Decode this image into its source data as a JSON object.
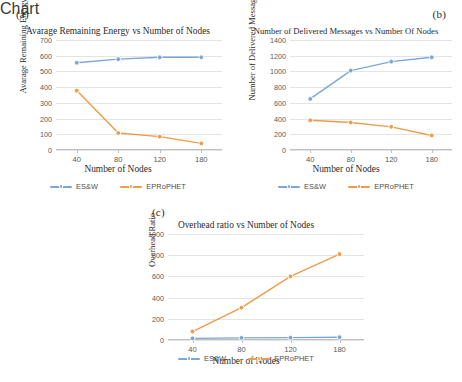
{
  "figure": {
    "panels": [
      {
        "id": "a",
        "label": "(a)",
        "chart_data": {
          "type": "line",
          "title": "Avarage Remaining Energy vs Number of Nodes",
          "xlabel": "Number of Nodes",
          "ylabel": "Avarage Remaining Energy",
          "categories": [
            "40",
            "80",
            "120",
            "180"
          ],
          "yticks": [
            "0",
            "100",
            "200",
            "300",
            "400",
            "500",
            "600",
            "700"
          ],
          "ylim": [
            0,
            700
          ],
          "grid": true,
          "legend_position": "bottom",
          "series": [
            {
              "name": "ES&W",
              "color": "#7BA7D7",
              "values": [
                555,
                578,
                590,
                590
              ]
            },
            {
              "name": "EPRoPHET",
              "color": "#ED9C4C",
              "values": [
                378,
                108,
                85,
                42
              ]
            }
          ]
        }
      },
      {
        "id": "b",
        "label": "(b)",
        "chart_data": {
          "type": "line",
          "title": "Number of Delivered Messages vs Number Of Nodes",
          "xlabel": "Number of Nodes",
          "ylabel": "Number of Delivered Messages",
          "categories": [
            "40",
            "80",
            "120",
            "180"
          ],
          "yticks": [
            "0",
            "200",
            "400",
            "600",
            "800",
            "1000",
            "1200",
            "1400"
          ],
          "ylim": [
            0,
            1400
          ],
          "grid": true,
          "legend_position": "bottom",
          "series": [
            {
              "name": "ES&W",
              "color": "#7BA7D7",
              "values": [
                650,
                1010,
                1125,
                1180
              ]
            },
            {
              "name": "EPRoPHET",
              "color": "#ED9C4C",
              "values": [
                378,
                350,
                295,
                185
              ]
            }
          ]
        }
      },
      {
        "id": "c",
        "label": "(c)",
        "chart_data": {
          "type": "line",
          "title": "Overhead ratio vs Number of Nodes",
          "xlabel": "Number of Nodes",
          "ylabel": "Overhead Ratio",
          "categories": [
            "40",
            "80",
            "120",
            "180"
          ],
          "yticks": [
            "0",
            "200",
            "400",
            "600",
            "800",
            "1000"
          ],
          "ylim": [
            0,
            1000
          ],
          "grid": true,
          "legend_position": "bottom",
          "series": [
            {
              "name": "ES&W",
              "color": "#7BA7D7",
              "values": [
                15,
                20,
                22,
                26
              ]
            },
            {
              "name": "EPRoPHET",
              "color": "#ED9C4C",
              "values": [
                80,
                305,
                600,
                810
              ]
            }
          ]
        }
      }
    ]
  }
}
